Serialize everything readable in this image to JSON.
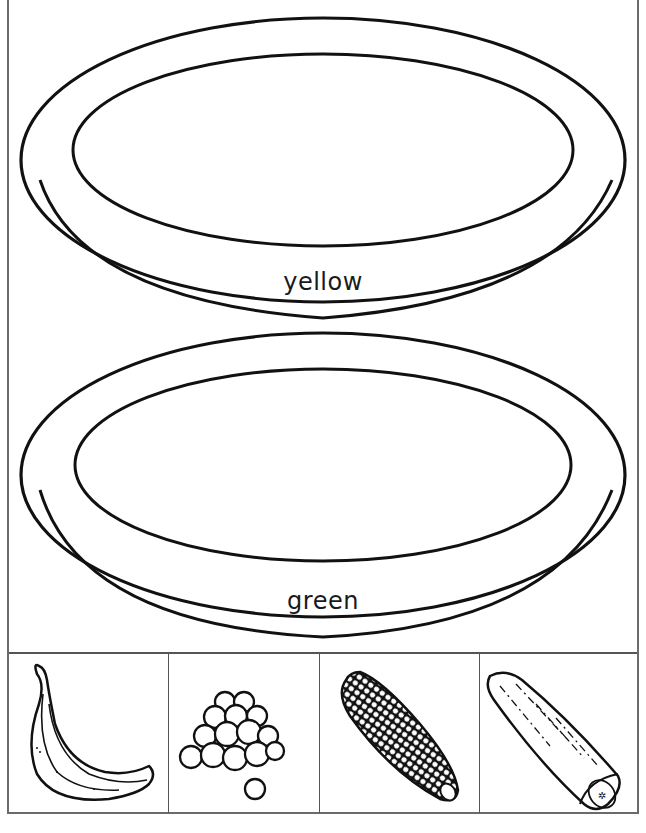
{
  "worksheet": {
    "plates": [
      {
        "label": "yellow",
        "color_name": "yellow"
      },
      {
        "label": "green",
        "color_name": "green"
      }
    ],
    "food_cards": [
      {
        "name": "banana",
        "icon": "banana-icon"
      },
      {
        "name": "grapes",
        "icon": "grapes-icon"
      },
      {
        "name": "corn",
        "icon": "corn-icon"
      },
      {
        "name": "cucumber",
        "icon": "cucumber-icon"
      }
    ]
  },
  "colors": {
    "line": "#111111",
    "frame": "#6b6b6b",
    "background": "#ffffff"
  }
}
